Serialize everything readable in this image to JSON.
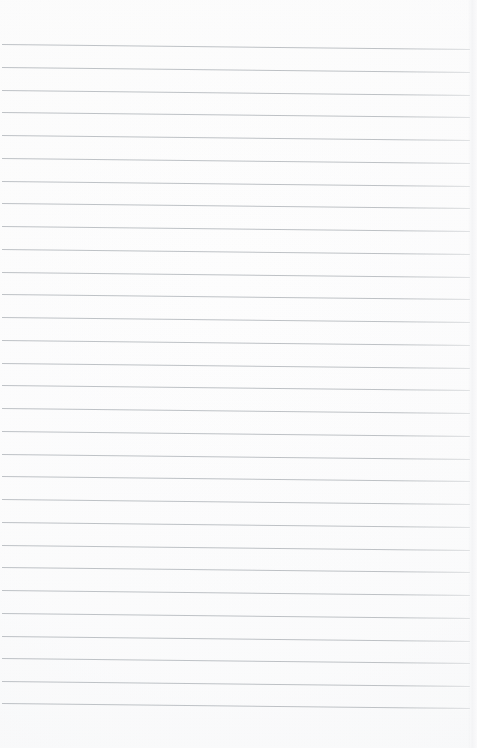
{
  "page": {
    "kind": "scanned-blank-ruled-paper",
    "width": 477,
    "height": 748,
    "content_text": "",
    "handwriting_present": false,
    "printed_text_present": false
  },
  "colors": {
    "paper": "#fdfdfd",
    "paper_shadow": "#f6f7f8",
    "rule_line": "#b9bdc1",
    "scan_edge": "#eceded",
    "page_border": "#ffffff"
  },
  "ruling": {
    "line_count": 30,
    "spacing_px": 22.75,
    "first_line_y": 44,
    "last_line_y": 703,
    "line_thickness_px": 1,
    "line_left_x": 2,
    "line_right_x": 470,
    "skew_drop_px": 5,
    "style": "horizontal-ruled",
    "margin_rule_present": false
  },
  "margins": {
    "top_px": 44,
    "bottom_px": 45,
    "left_px": 2,
    "right_px": 7
  },
  "lines": [
    {
      "index": 1,
      "y_left": 44.0,
      "y_right": 49.0
    },
    {
      "index": 2,
      "y_left": 66.8,
      "y_right": 71.8
    },
    {
      "index": 3,
      "y_left": 89.5,
      "y_right": 94.5
    },
    {
      "index": 4,
      "y_left": 112.3,
      "y_right": 117.3
    },
    {
      "index": 5,
      "y_left": 135.0,
      "y_right": 140.0
    },
    {
      "index": 6,
      "y_left": 157.8,
      "y_right": 162.8
    },
    {
      "index": 7,
      "y_left": 180.5,
      "y_right": 185.5
    },
    {
      "index": 8,
      "y_left": 203.3,
      "y_right": 208.3
    },
    {
      "index": 9,
      "y_left": 226.0,
      "y_right": 231.0
    },
    {
      "index": 10,
      "y_left": 248.8,
      "y_right": 253.8
    },
    {
      "index": 11,
      "y_left": 271.5,
      "y_right": 276.5
    },
    {
      "index": 12,
      "y_left": 294.3,
      "y_right": 299.3
    },
    {
      "index": 13,
      "y_left": 317.0,
      "y_right": 322.0
    },
    {
      "index": 14,
      "y_left": 339.8,
      "y_right": 344.8
    },
    {
      "index": 15,
      "y_left": 362.5,
      "y_right": 367.5
    },
    {
      "index": 16,
      "y_left": 385.3,
      "y_right": 390.3
    },
    {
      "index": 17,
      "y_left": 408.0,
      "y_right": 413.0
    },
    {
      "index": 18,
      "y_left": 430.8,
      "y_right": 435.8
    },
    {
      "index": 19,
      "y_left": 453.5,
      "y_right": 458.5
    },
    {
      "index": 20,
      "y_left": 476.3,
      "y_right": 481.3
    },
    {
      "index": 21,
      "y_left": 499.0,
      "y_right": 504.0
    },
    {
      "index": 22,
      "y_left": 521.8,
      "y_right": 526.8
    },
    {
      "index": 23,
      "y_left": 544.5,
      "y_right": 549.5
    },
    {
      "index": 24,
      "y_left": 567.3,
      "y_right": 572.3
    },
    {
      "index": 25,
      "y_left": 590.0,
      "y_right": 595.0
    },
    {
      "index": 26,
      "y_left": 612.8,
      "y_right": 617.8
    },
    {
      "index": 27,
      "y_left": 635.5,
      "y_right": 640.5
    },
    {
      "index": 28,
      "y_left": 658.3,
      "y_right": 663.3
    },
    {
      "index": 29,
      "y_left": 681.0,
      "y_right": 686.0
    },
    {
      "index": 30,
      "y_left": 703.0,
      "y_right": 708.0
    }
  ]
}
